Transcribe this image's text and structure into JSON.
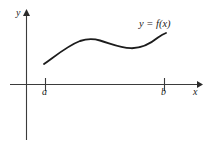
{
  "figure": {
    "background_color": "#ffffff",
    "curve_color": "#1c1c1c",
    "axis_color": "#3b3b3b",
    "text_color": "#1c1c1c"
  },
  "labels": {
    "y_axis": "y",
    "x_axis": "x",
    "interval_start": "a",
    "interval_end": "b",
    "function": "y = f(x)"
  },
  "chart_data": {
    "type": "line",
    "title": "",
    "subtitle": "",
    "xlabel": "x",
    "ylabel": "y",
    "legend": [
      "y = f(x)"
    ],
    "legend_position": "upper-right-inline",
    "grid": false,
    "annotations": [
      "y = f(x)",
      "a",
      "b"
    ],
    "axes": {
      "x_axis_y_pixel": 84,
      "y_axis_x_pixel": 26,
      "x_axis_from_pixel": 10,
      "x_axis_to_pixel": 200,
      "y_axis_from_pixel": 140,
      "y_axis_to_pixel": 12,
      "x_arrow": true,
      "y_arrow": true
    },
    "ticks": {
      "x": [
        {
          "label": "a",
          "pixel_x": 45
        },
        {
          "label": "b",
          "pixel_x": 164
        }
      ],
      "y": []
    },
    "series": [
      {
        "name": "y = f(x)",
        "points": [
          {
            "x": 44,
            "y": 64
          },
          {
            "x": 52,
            "y": 58
          },
          {
            "x": 60,
            "y": 52
          },
          {
            "x": 68,
            "y": 47
          },
          {
            "x": 76,
            "y": 43
          },
          {
            "x": 84,
            "y": 40
          },
          {
            "x": 90,
            "y": 39
          },
          {
            "x": 97,
            "y": 39
          },
          {
            "x": 105,
            "y": 41
          },
          {
            "x": 113,
            "y": 44
          },
          {
            "x": 121,
            "y": 46
          },
          {
            "x": 129,
            "y": 48
          },
          {
            "x": 136,
            "y": 48
          },
          {
            "x": 144,
            "y": 46
          },
          {
            "x": 152,
            "y": 42
          },
          {
            "x": 159,
            "y": 37
          },
          {
            "x": 166,
            "y": 33
          }
        ],
        "path_d": "M 44 64 C 56 55.5, 68 45.5, 80 41 C 86.5 38.8, 93.5 38.6, 100 40.5 C 112 44, 120 47.8, 131 48.2 C 141 48.5, 150 44, 158 37.5 C 161.5 35, 164 33.7, 166 33"
      }
    ]
  }
}
